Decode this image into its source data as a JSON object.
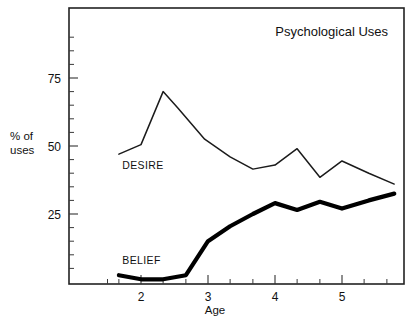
{
  "chart_data": {
    "type": "line",
    "title": "Psychological Uses",
    "xlabel": "Age",
    "ylabel_line1": "% of",
    "ylabel_line2": "uses",
    "ylabel": "% of uses",
    "grid": false,
    "legend_position": "inline-labels",
    "xlim": [
      1.3,
      5.85
    ],
    "ylim": [
      0,
      92
    ],
    "x_ticks_major": [
      2,
      3,
      4,
      5
    ],
    "x_tick_labels": [
      "2",
      "3",
      "4",
      "5"
    ],
    "x_ticks_minor": [
      1.5,
      1.67,
      2.33,
      2.67,
      3.33,
      3.67,
      4.33,
      4.67,
      5.33,
      5.67
    ],
    "y_ticks_major": [
      25,
      50,
      75
    ],
    "y_tick_labels": [
      "25",
      "50",
      "75"
    ],
    "y_ticks_minor": [
      5,
      10,
      15,
      20,
      30,
      35,
      40,
      45,
      55,
      60,
      65,
      70,
      80,
      85,
      90
    ],
    "series": [
      {
        "name": "DESIRE",
        "style": "thin",
        "label": "DESIRE",
        "label_x": 1.72,
        "label_y": 41.5,
        "x": [
          1.67,
          2.0,
          2.33,
          2.55,
          2.95,
          3.33,
          3.67,
          4.0,
          4.33,
          4.67,
          5.0,
          5.4,
          5.78
        ],
        "values": [
          47,
          50.5,
          70,
          64,
          52.5,
          46,
          41.5,
          43,
          49,
          38.5,
          44.5,
          40,
          36
        ]
      },
      {
        "name": "BELIEF",
        "style": "thick",
        "label": "BELIEF",
        "label_x": 1.72,
        "label_y": 6.5,
        "x": [
          1.67,
          2.0,
          2.33,
          2.67,
          3.0,
          3.33,
          3.67,
          4.0,
          4.33,
          4.67,
          5.0,
          5.4,
          5.78
        ],
        "values": [
          2.5,
          1.0,
          1.0,
          2.5,
          15,
          20.5,
          25,
          29,
          26.5,
          29.5,
          27,
          30,
          32.5
        ]
      }
    ]
  },
  "figure": {
    "background_color": "#ffffff",
    "frame_color": "#222222",
    "line_color_desire": "#1b1b1b",
    "line_color_belief": "#000000"
  }
}
